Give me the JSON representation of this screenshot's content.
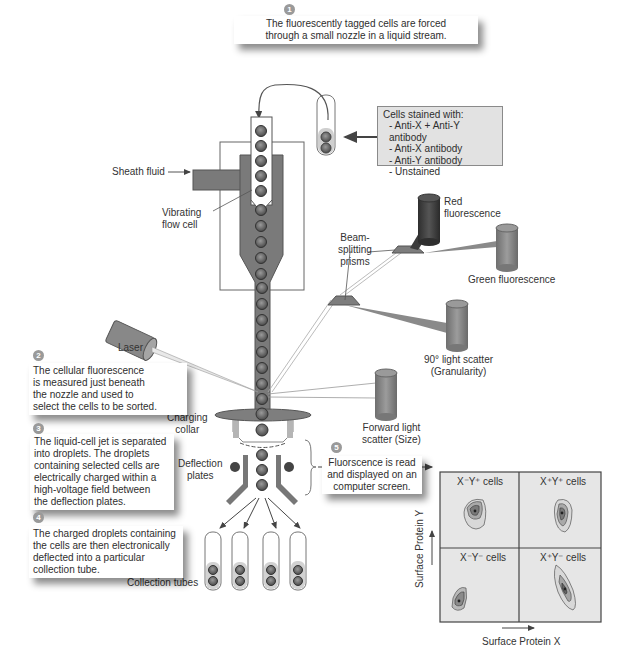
{
  "steps": [
    {
      "number": "1",
      "text": "The fluorescently tagged cells are forced through a small nozzle in a liquid stream.",
      "lines": [
        "The fluorescently tagged cells are forced",
        "through a small nozzle in a liquid stream."
      ]
    },
    {
      "number": "2",
      "text": "The cellular fluorescence is measured just beneath the nozzle and used to select the cells to be sorted.",
      "lines": [
        "The cellular fluorescence",
        "is measured just beneath",
        "the nozzle and used to",
        "select the cells to be sorted."
      ]
    },
    {
      "number": "3",
      "text": "The liquid-cell jet is separated into droplets. The droplets containing selected cells are electrically charged within a high-voltage field between the deflection plates.",
      "lines": [
        "The liquid-cell jet is separated",
        "into droplets.  The droplets",
        "containing selected cells are",
        "electrically charged within a",
        "high-voltage field between",
        "the deflection plates."
      ]
    },
    {
      "number": "4",
      "text": "The charged droplets containing the cells are then electronically deflected into a particular collection tube.",
      "lines": [
        "The charged droplets containing",
        "the cells are then electronically",
        "deflected into a particular",
        "collection tube."
      ]
    },
    {
      "number": "5",
      "text": "Fluorscence is read and displayed on an computer screen.",
      "lines": [
        "Fluorscence is read",
        "and displayed on an",
        "computer screen."
      ]
    }
  ],
  "stain_box": {
    "title": "Cells stained with:",
    "items": [
      "- Anti-X + Anti-Y antibody",
      "- Anti-X antibody",
      "- Anti-Y antibody",
      "- Unstained"
    ]
  },
  "labels": {
    "sheath_fluid": "Sheath fluid",
    "vibrating_flow_cell": [
      "Vibrating",
      "flow cell"
    ],
    "beam_splitting_prisms": [
      "Beam-",
      "splitting",
      "prisms"
    ],
    "red_fluorescence": [
      "Red",
      "fluorescence"
    ],
    "green_fluorescence": "Green fluorescence",
    "laser": "Laser",
    "light_scatter_90": [
      "90° light scatter",
      "(Granularity)"
    ],
    "forward_light_scatter": [
      "Forward light",
      "scatter (Size)"
    ],
    "charging_collar": [
      "Charging",
      "collar"
    ],
    "deflection_plates": [
      "Deflection",
      "plates"
    ],
    "collection_tubes": "Collection tubes"
  },
  "plot": {
    "x_axis": "Surface Protein X",
    "y_axis": "Surface Protein Y",
    "quadrants": [
      {
        "position": "top-left",
        "label": "X⁻Y⁺ cells"
      },
      {
        "position": "top-right",
        "label": "X⁺Y⁺ cells"
      },
      {
        "position": "bottom-left",
        "label": "X⁻Y⁻ cells"
      },
      {
        "position": "bottom-right",
        "label": "X⁺Y⁻ cells"
      }
    ]
  },
  "colors": {
    "dark_gray": "#555555",
    "mid_gray": "#8c8c8c",
    "light_gray": "#d9d9d9",
    "plot_bg": "#e6e6e6",
    "red_detector": "#3a3a3a",
    "badge": "#9a9a9a"
  }
}
